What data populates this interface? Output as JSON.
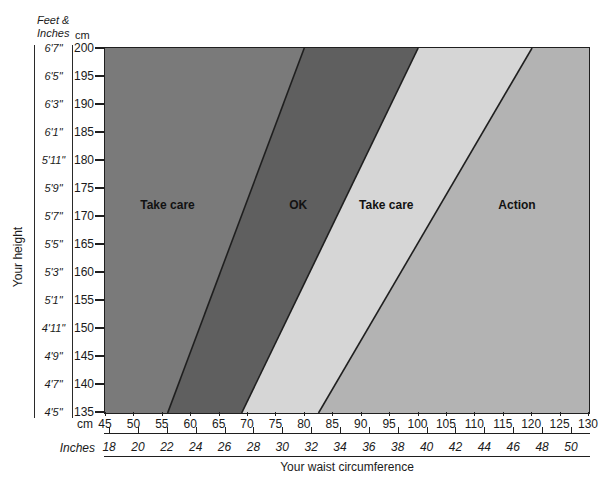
{
  "y_axis": {
    "title": "Your height",
    "header_line1": "Feet &",
    "header_line2": "Inches",
    "cm_header": "cm",
    "feet_inch_labels": [
      "6'7\"",
      "6'5\"",
      "6'3\"",
      "6'1\"",
      "5'11\"",
      "5'9\"",
      "5'7\"",
      "5'5\"",
      "5'3\"",
      "5'1\"",
      "4'11\"",
      "4'9\"",
      "4'7\"",
      "4'5\""
    ],
    "cm_labels": [
      200,
      195,
      190,
      185,
      180,
      175,
      170,
      165,
      160,
      155,
      150,
      145,
      140,
      135
    ]
  },
  "x_axis": {
    "title": "Your waist circumference",
    "cm_unit_label": "cm",
    "inches_unit_label": "Inches",
    "cm_ticks": [
      45,
      50,
      55,
      60,
      65,
      70,
      75,
      80,
      85,
      90,
      95,
      100,
      105,
      110,
      115,
      120,
      125,
      130
    ],
    "inch_ticks": [
      18,
      20,
      22,
      24,
      26,
      28,
      30,
      32,
      34,
      36,
      38,
      40,
      42,
      44,
      46,
      48,
      50
    ]
  },
  "chart_data": {
    "type": "area",
    "x_label": "Your waist circumference",
    "y_label": "Your height",
    "x_unit": "cm",
    "y_unit": "cm",
    "x_range_cm": [
      45,
      130
    ],
    "y_range_cm": [
      135,
      200
    ],
    "cm_per_inch": 2.54,
    "line_color": "#1f1f1f",
    "zones": [
      {
        "label": "Take care",
        "color": "#7a7a7a",
        "label_waist_cm": 56,
        "label_height_cm": 172
      },
      {
        "label": "OK",
        "color": "#5f5f5f",
        "label_waist_cm": 79,
        "label_height_cm": 172
      },
      {
        "label": "Take care",
        "color": "#d6d6d6",
        "label_waist_cm": 94.5,
        "label_height_cm": 172
      },
      {
        "label": "Action",
        "color": "#b3b3b3",
        "label_waist_cm": 117.5,
        "label_height_cm": 172
      }
    ],
    "zone_boundaries": [
      {
        "between": [
          "Take care",
          "OK"
        ],
        "waist_cm_at_height_135": 56,
        "waist_cm_at_height_200": 80
      },
      {
        "between": [
          "OK",
          "Take care"
        ],
        "waist_cm_at_height_135": 69,
        "waist_cm_at_height_200": 100
      },
      {
        "between": [
          "Take care",
          "Action"
        ],
        "waist_cm_at_height_135": 82.5,
        "waist_cm_at_height_200": 120
      }
    ]
  }
}
